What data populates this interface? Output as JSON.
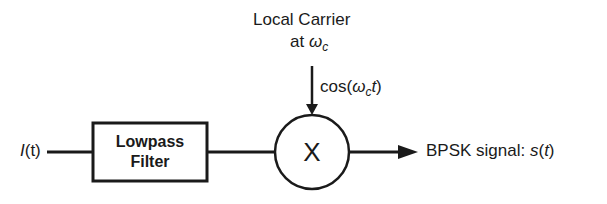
{
  "diagram": {
    "input": {
      "label": "I",
      "arg": "(t)"
    },
    "filter": {
      "line1": "Lowpass",
      "line2": "Filter"
    },
    "carrier": {
      "line1": "Local Carrier",
      "line2_prefix": "at ",
      "omega": "ω",
      "sub": "c"
    },
    "carrier_signal": {
      "prefix": "cos(",
      "omega": "ω",
      "sub": "c",
      "t": "t",
      "suffix": ")"
    },
    "multiplier": {
      "symbol": "X"
    },
    "output": {
      "label": "BPSK signal: ",
      "s": "s",
      "arg_open": "(",
      "t": "t",
      "arg_close": ")"
    },
    "colors": {
      "stroke": "#1a1a1a",
      "background": "#ffffff"
    }
  }
}
